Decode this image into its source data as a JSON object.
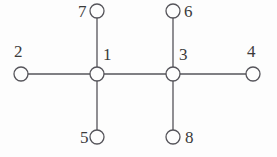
{
  "figure": {
    "name": "undirected-graph-diagram",
    "background_color": "#fdfdfd",
    "stroke_color": "#55545a",
    "node_fill_color": "#fdfdfd",
    "label_color": "#3b3b3b",
    "node_radius": 7,
    "stroke_width": 1.3,
    "width": 277,
    "height": 157
  },
  "graph_data": {
    "type": "node-link-diagram",
    "directed": false,
    "node_count": 8,
    "edge_count": 7,
    "nodes": [
      {
        "id": "1",
        "label": "1",
        "cx": 97,
        "cy": 74,
        "label_x": 103,
        "label_y": 46,
        "label_anchor": "left"
      },
      {
        "id": "2",
        "label": "2",
        "cx": 21,
        "cy": 74,
        "label_x": 14,
        "label_y": 43,
        "label_anchor": "left"
      },
      {
        "id": "3",
        "label": "3",
        "cx": 173,
        "cy": 74,
        "label_x": 179,
        "label_y": 46,
        "label_anchor": "left"
      },
      {
        "id": "4",
        "label": "4",
        "cx": 253,
        "cy": 74,
        "label_x": 247,
        "label_y": 43,
        "label_anchor": "left"
      },
      {
        "id": "5",
        "label": "5",
        "cx": 97,
        "cy": 137,
        "label_x": 80,
        "label_y": 129,
        "label_anchor": "left"
      },
      {
        "id": "6",
        "label": "6",
        "cx": 173,
        "cy": 11,
        "label_x": 184,
        "label_y": 3,
        "label_anchor": "left"
      },
      {
        "id": "7",
        "label": "7",
        "cx": 97,
        "cy": 11,
        "label_x": 78,
        "label_y": 3,
        "label_anchor": "left"
      },
      {
        "id": "8",
        "label": "8",
        "cx": 173,
        "cy": 137,
        "label_x": 185,
        "label_y": 129,
        "label_anchor": "left"
      }
    ],
    "edges": [
      {
        "source": "2",
        "target": "1",
        "orientation": "horizontal"
      },
      {
        "source": "1",
        "target": "3",
        "orientation": "horizontal"
      },
      {
        "source": "3",
        "target": "4",
        "orientation": "horizontal"
      },
      {
        "source": "7",
        "target": "1",
        "orientation": "vertical"
      },
      {
        "source": "1",
        "target": "5",
        "orientation": "vertical"
      },
      {
        "source": "6",
        "target": "3",
        "orientation": "vertical"
      },
      {
        "source": "3",
        "target": "8",
        "orientation": "vertical"
      }
    ]
  }
}
